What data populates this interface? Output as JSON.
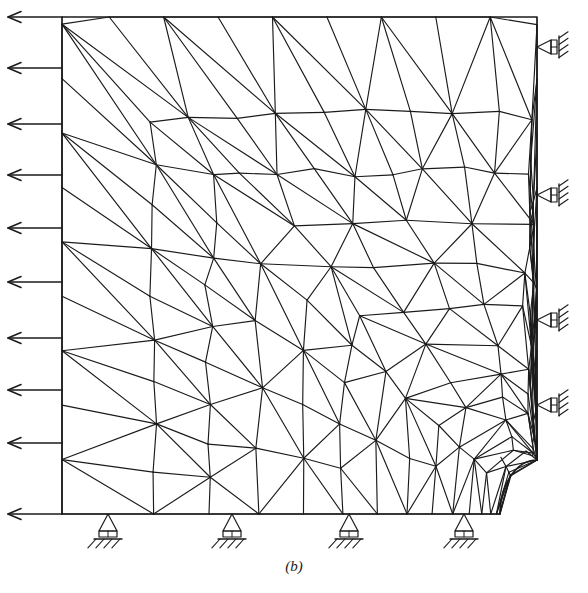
{
  "figure": {
    "caption": "(b)",
    "ink_color": "#1b1b1b",
    "background_color": "#ffffff"
  },
  "domain": {
    "type": "square-plate-with-quarter-circular-notch",
    "left": 62,
    "top": 17,
    "right": 537,
    "bottom": 514,
    "hole": {
      "shape": "quarter-circle",
      "center_x": 537,
      "center_y": 514,
      "radius_x": 37,
      "radius_y": 54,
      "corner": "bottom-right"
    }
  },
  "loads": {
    "name": "traction-arrows",
    "edge": "left",
    "direction": "left",
    "count": 10,
    "tail_x": 62,
    "head_x": 8,
    "y_positions": [
      17,
      68,
      124,
      175,
      228,
      282,
      338,
      390,
      443,
      514
    ]
  },
  "supports": {
    "right_edge": {
      "name": "roller-support-right",
      "type": "roller",
      "x": 537,
      "y_positions": [
        47,
        195,
        320,
        405
      ]
    },
    "bottom_edge": {
      "name": "roller-support-bottom",
      "type": "roller",
      "y": 514,
      "x_positions": [
        108,
        232,
        349,
        464
      ]
    }
  },
  "mesh_data": {
    "type": "triangular-finite-element-mesh",
    "description": "Graded unstructured triangular mesh, refined radially toward the quarter-circular hole at the bottom-right corner.",
    "radial_rings": 15,
    "angular_divisions": 26,
    "grading_exponent": 2.35,
    "outer_ring_fraction": 0.93,
    "jitter_seed": 20394,
    "jitter_amount": 0.17,
    "line_width": 1.15
  }
}
